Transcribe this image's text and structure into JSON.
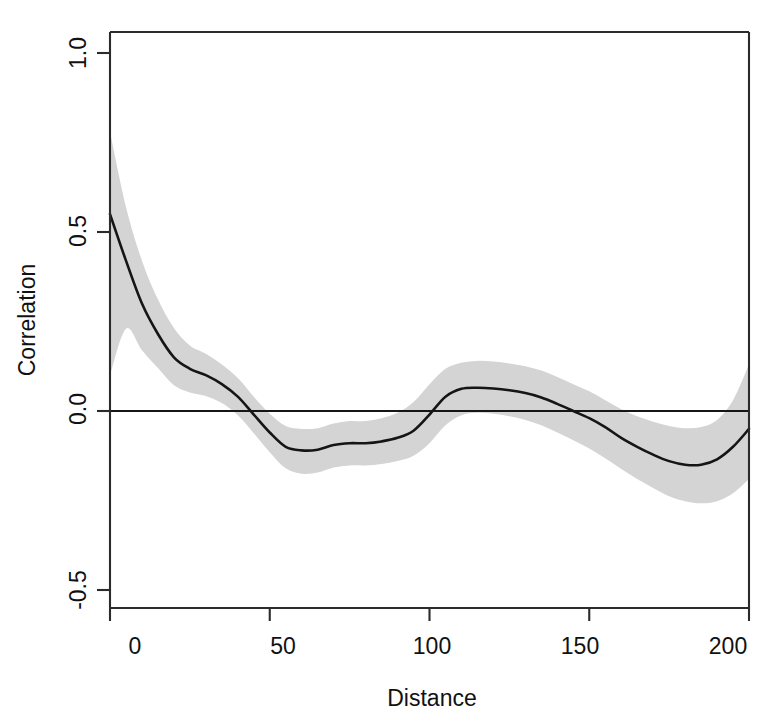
{
  "figure": {
    "background_color": "#ffffff",
    "plot_area": {
      "left": 110,
      "top": 32,
      "right": 749,
      "bottom": 608
    }
  },
  "axes": {
    "y_title": "Correlation",
    "x_title": "Distance",
    "y_ticks": [
      "1.0",
      "0.5",
      "0.0",
      "-0.5"
    ],
    "x_ticks": [
      "0",
      "50",
      "100",
      "150",
      "200"
    ]
  },
  "style": {
    "band_color": "#d4d4d4",
    "line_color": "#151515",
    "frame_color": "#2b2b2b",
    "zero_line_color": "#151515"
  },
  "chart_data": {
    "type": "line",
    "title": "",
    "subtitle": "",
    "xlabel": "Distance",
    "ylabel": "Correlation",
    "xlim": [
      0,
      200
    ],
    "ylim": [
      -0.5,
      1.0
    ],
    "grid": false,
    "legend": "none",
    "annotations": [
      {
        "kind": "reference-line",
        "orientation": "horizontal",
        "y": 0.0,
        "label": "zero correlation reference line"
      },
      {
        "kind": "band",
        "label": "pointwise confidence envelope",
        "color": "#d4d4d4"
      }
    ],
    "x": [
      0,
      5,
      10,
      15,
      20,
      25,
      30,
      35,
      40,
      45,
      50,
      55,
      60,
      65,
      70,
      75,
      80,
      85,
      90,
      95,
      100,
      105,
      110,
      115,
      120,
      125,
      130,
      135,
      140,
      145,
      150,
      155,
      160,
      165,
      170,
      175,
      180,
      185,
      190,
      195,
      200
    ],
    "series": [
      {
        "name": "Correlation (fitted)",
        "values": [
          0.55,
          0.42,
          0.3,
          0.215,
          0.15,
          0.118,
          0.1,
          0.075,
          0.04,
          -0.01,
          -0.06,
          -0.1,
          -0.11,
          -0.108,
          -0.095,
          -0.09,
          -0.09,
          -0.085,
          -0.075,
          -0.055,
          -0.01,
          0.04,
          0.062,
          0.065,
          0.063,
          0.058,
          0.05,
          0.038,
          0.02,
          0.0,
          -0.02,
          -0.045,
          -0.075,
          -0.1,
          -0.122,
          -0.14,
          -0.15,
          -0.15,
          -0.135,
          -0.1,
          -0.05
        ]
      },
      {
        "name": "Upper confidence bound",
        "values": [
          0.78,
          0.57,
          0.42,
          0.312,
          0.232,
          0.183,
          0.16,
          0.13,
          0.092,
          0.04,
          -0.008,
          -0.042,
          -0.05,
          -0.048,
          -0.035,
          -0.028,
          -0.028,
          -0.02,
          -0.005,
          0.025,
          0.075,
          0.118,
          0.135,
          0.14,
          0.138,
          0.133,
          0.125,
          0.113,
          0.095,
          0.075,
          0.055,
          0.03,
          0.005,
          -0.015,
          -0.03,
          -0.042,
          -0.048,
          -0.045,
          -0.025,
          0.03,
          0.13
        ]
      },
      {
        "name": "Lower confidence bound",
        "values": [
          0.1,
          0.23,
          0.17,
          0.12,
          0.072,
          0.052,
          0.042,
          0.022,
          -0.012,
          -0.062,
          -0.115,
          -0.16,
          -0.175,
          -0.172,
          -0.158,
          -0.152,
          -0.152,
          -0.148,
          -0.14,
          -0.125,
          -0.09,
          -0.04,
          -0.012,
          -0.005,
          -0.008,
          -0.015,
          -0.025,
          -0.04,
          -0.06,
          -0.082,
          -0.105,
          -0.132,
          -0.162,
          -0.19,
          -0.215,
          -0.238,
          -0.252,
          -0.258,
          -0.252,
          -0.23,
          -0.19
        ]
      }
    ]
  }
}
